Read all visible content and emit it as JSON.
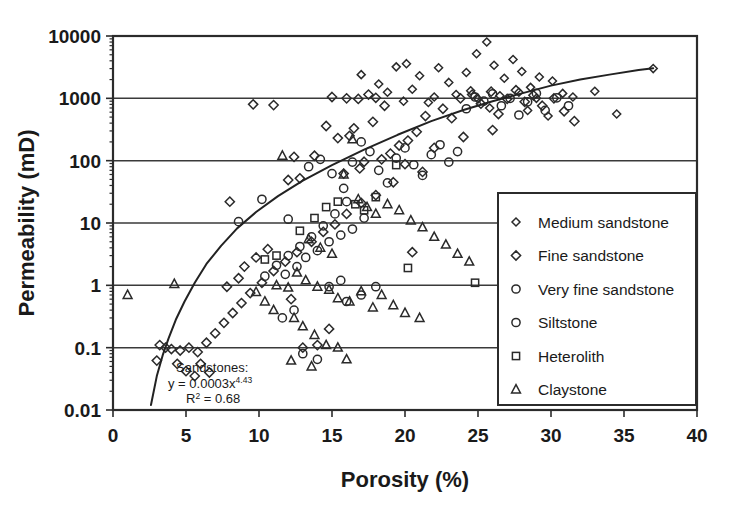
{
  "chart_data": {
    "type": "scatter",
    "title": "",
    "xlabel": "Porosity (%)",
    "ylabel": "Permeability (mD)",
    "xlim": [
      0,
      40
    ],
    "ylim": [
      0.01,
      10000
    ],
    "yscale": "log",
    "xscale": "linear",
    "xticks": [
      0,
      5,
      10,
      15,
      20,
      25,
      30,
      35,
      40
    ],
    "xtick_labels": [
      "0",
      "5",
      "10",
      "15",
      "20",
      "25",
      "30",
      "35",
      "40"
    ],
    "yticks": [
      0.01,
      0.1,
      1,
      10,
      100,
      1000,
      10000
    ],
    "ytick_labels": [
      "0.01",
      "0.1",
      "1",
      "10",
      "100",
      "1000",
      "10000"
    ],
    "grid": "horizontal-major",
    "legend_position": "lower-right-inside",
    "annotation": {
      "line1": "Sandstones:",
      "line2_prefix": "y = 0.0003x",
      "line2_exponent": "4.43",
      "line3_prefix": "R",
      "line3_sup": "2",
      "line3_suffix": " = 0.68"
    },
    "trendline": {
      "label": "Sandstone power-law fit",
      "equation": "y = 0.0003x^4.43",
      "r_squared": 0.68,
      "points": [
        [
          2.6,
          0.012
        ],
        [
          3.0,
          0.035
        ],
        [
          3.4,
          0.075
        ],
        [
          3.8,
          0.14
        ],
        [
          4.3,
          0.28
        ],
        [
          4.9,
          0.55
        ],
        [
          5.6,
          1.1
        ],
        [
          6.4,
          2.2
        ],
        [
          7.4,
          4.3
        ],
        [
          8.5,
          8.2
        ],
        [
          9.8,
          15.0
        ],
        [
          11.3,
          27.0
        ],
        [
          13.0,
          48.0
        ],
        [
          15.0,
          85.0
        ],
        [
          17.2,
          150.0
        ],
        [
          19.5,
          260.0
        ],
        [
          21.8,
          430.0
        ],
        [
          24.0,
          650.0
        ],
        [
          26.0,
          900.0
        ],
        [
          28.0,
          1200.0
        ],
        [
          30.0,
          1600.0
        ],
        [
          32.0,
          2000.0
        ],
        [
          34.0,
          2400.0
        ],
        [
          36.0,
          2850.0
        ],
        [
          37.0,
          3050.0
        ]
      ]
    },
    "series": [
      {
        "name": "Medium sandstone",
        "marker": "diamond-small",
        "points": [
          [
            17.0,
            2400
          ],
          [
            18.2,
            1700
          ],
          [
            19.4,
            3200
          ],
          [
            20.1,
            3600
          ],
          [
            21.0,
            2300
          ],
          [
            22.3,
            3100
          ],
          [
            23.0,
            1800
          ],
          [
            24.2,
            2600
          ],
          [
            24.9,
            5200
          ],
          [
            25.6,
            8000
          ],
          [
            26.1,
            3400
          ],
          [
            26.8,
            2100
          ],
          [
            27.4,
            4200
          ],
          [
            28.0,
            2700
          ],
          [
            28.6,
            1500
          ],
          [
            29.2,
            2200
          ],
          [
            30.1,
            1900
          ],
          [
            30.8,
            1200
          ],
          [
            22.0,
            1050
          ],
          [
            23.5,
            1150
          ],
          [
            25.0,
            980
          ],
          [
            26.5,
            1100
          ],
          [
            27.8,
            1250
          ],
          [
            29.0,
            1000
          ],
          [
            31.5,
            1050
          ],
          [
            33.0,
            1300
          ],
          [
            34.5,
            560
          ],
          [
            37.0,
            3000
          ],
          [
            20.5,
            1400
          ],
          [
            21.6,
            860
          ],
          [
            24.5,
            1320
          ],
          [
            25.8,
            700
          ],
          [
            28.4,
            640
          ],
          [
            29.8,
            520
          ],
          [
            18.8,
            1250
          ],
          [
            19.9,
            900
          ]
        ]
      },
      {
        "name": "Fine sandstone",
        "marker": "diamond",
        "points": [
          [
            8.0,
            22
          ],
          [
            9.6,
            800
          ],
          [
            12.4,
            115
          ],
          [
            13.8,
            120
          ],
          [
            11.0,
            780
          ],
          [
            12.0,
            49
          ],
          [
            12.8,
            52
          ],
          [
            14.6,
            360
          ],
          [
            15.4,
            230
          ],
          [
            16.2,
            250
          ],
          [
            15.0,
            1050
          ],
          [
            16.0,
            1000
          ],
          [
            16.8,
            980
          ],
          [
            17.5,
            1150
          ],
          [
            18.0,
            1020
          ],
          [
            18.6,
            760
          ],
          [
            17.8,
            420
          ],
          [
            16.5,
            330
          ],
          [
            15.8,
            62
          ],
          [
            16.9,
            75
          ],
          [
            17.2,
            96
          ],
          [
            18.4,
            105
          ],
          [
            19.0,
            130
          ],
          [
            19.6,
            175
          ],
          [
            20.2,
            210
          ],
          [
            20.8,
            290
          ],
          [
            21.4,
            520
          ],
          [
            22.6,
            680
          ],
          [
            23.2,
            480
          ],
          [
            23.8,
            1000
          ],
          [
            24.6,
            1150
          ],
          [
            25.2,
            820
          ],
          [
            25.9,
            1280
          ],
          [
            26.4,
            560
          ],
          [
            27.0,
            980
          ],
          [
            27.6,
            1350
          ],
          [
            28.2,
            880
          ],
          [
            28.8,
            1120
          ],
          [
            29.4,
            760
          ],
          [
            30.2,
            1000
          ],
          [
            30.9,
            620
          ],
          [
            31.6,
            430
          ],
          [
            26.0,
            310
          ],
          [
            24.0,
            240
          ],
          [
            22.0,
            160
          ],
          [
            20.0,
            88
          ],
          [
            21.2,
            66
          ],
          [
            19.2,
            45
          ],
          [
            18.0,
            28
          ],
          [
            17.0,
            21
          ],
          [
            16.0,
            14
          ],
          [
            15.2,
            9.5
          ],
          [
            14.4,
            7.2
          ],
          [
            13.6,
            5.0
          ],
          [
            12.6,
            3.4
          ],
          [
            11.8,
            2.4
          ],
          [
            11.0,
            1.7
          ],
          [
            10.2,
            1.1
          ],
          [
            9.4,
            0.75
          ],
          [
            8.8,
            0.52
          ],
          [
            8.2,
            0.36
          ],
          [
            7.6,
            0.25
          ],
          [
            7.0,
            0.17
          ],
          [
            6.4,
            0.12
          ],
          [
            5.8,
            0.085
          ],
          [
            5.2,
            0.1
          ],
          [
            4.6,
            0.09
          ],
          [
            4.0,
            0.095
          ],
          [
            3.6,
            0.1
          ],
          [
            3.2,
            0.11
          ],
          [
            4.4,
            0.055
          ],
          [
            5.0,
            0.042
          ],
          [
            5.6,
            0.035
          ],
          [
            6.0,
            0.055
          ],
          [
            6.6,
            0.04
          ],
          [
            3.0,
            0.062
          ],
          [
            7.8,
            0.95
          ],
          [
            8.6,
            1.3
          ],
          [
            9.0,
            2.0
          ],
          [
            9.8,
            2.8
          ],
          [
            10.6,
            3.8
          ],
          [
            13.0,
            0.1
          ],
          [
            14.0,
            0.11
          ],
          [
            20.5,
            3.4
          ],
          [
            14.8,
            0.2
          ],
          [
            12.2,
            0.6
          ]
        ]
      },
      {
        "name": "Very fine sandstone",
        "marker": "circle",
        "points": [
          [
            8.6,
            10.5
          ],
          [
            10.2,
            24
          ],
          [
            12.0,
            11.5
          ],
          [
            13.4,
            80
          ],
          [
            14.2,
            105
          ],
          [
            15.0,
            62
          ],
          [
            15.8,
            36
          ],
          [
            16.4,
            95
          ],
          [
            17.0,
            200
          ],
          [
            17.6,
            140
          ],
          [
            18.2,
            70
          ],
          [
            18.8,
            44
          ],
          [
            19.4,
            110
          ],
          [
            20.0,
            160
          ],
          [
            20.6,
            86
          ],
          [
            21.2,
            58
          ],
          [
            21.8,
            125
          ],
          [
            22.4,
            180
          ],
          [
            23.0,
            95
          ],
          [
            23.6,
            140
          ],
          [
            24.2,
            680
          ],
          [
            24.8,
            1050
          ],
          [
            25.4,
            900
          ],
          [
            26.0,
            1180
          ],
          [
            26.6,
            760
          ],
          [
            27.2,
            1000
          ],
          [
            27.8,
            540
          ],
          [
            28.4,
            880
          ],
          [
            29.0,
            1200
          ],
          [
            29.6,
            640
          ],
          [
            30.4,
            1020
          ],
          [
            31.2,
            760
          ],
          [
            16.0,
            22
          ],
          [
            15.2,
            14
          ],
          [
            14.4,
            9.0
          ],
          [
            13.6,
            6.0
          ],
          [
            12.8,
            4.2
          ],
          [
            12.0,
            3.0
          ],
          [
            11.2,
            2.1
          ],
          [
            10.4,
            1.4
          ],
          [
            14.8,
            0.95
          ],
          [
            15.6,
            1.2
          ],
          [
            13.0,
            0.08
          ],
          [
            14.0,
            0.065
          ],
          [
            11.6,
            0.3
          ],
          [
            12.4,
            0.4
          ]
        ]
      },
      {
        "name": "Siltstone",
        "marker": "circle-bold",
        "points": [
          [
            13.2,
            2.8
          ],
          [
            14.0,
            3.6
          ],
          [
            14.8,
            5.0
          ],
          [
            15.6,
            6.4
          ],
          [
            16.4,
            8.0
          ],
          [
            17.2,
            12.0
          ],
          [
            12.6,
            2.0
          ],
          [
            11.8,
            1.5
          ],
          [
            16.0,
            0.55
          ],
          [
            17.0,
            0.7
          ],
          [
            18.0,
            0.95
          ]
        ]
      },
      {
        "name": "Heterolith",
        "marker": "square",
        "points": [
          [
            14.6,
            18
          ],
          [
            15.4,
            22
          ],
          [
            16.6,
            20
          ],
          [
            17.2,
            16
          ],
          [
            18.0,
            26
          ],
          [
            19.4,
            85
          ],
          [
            13.8,
            12
          ],
          [
            12.8,
            7.5
          ],
          [
            10.4,
            2.6
          ],
          [
            11.2,
            3.0
          ],
          [
            24.8,
            1.1
          ],
          [
            20.2,
            1.9
          ]
        ]
      },
      {
        "name": "Claystone",
        "marker": "triangle",
        "points": [
          [
            1.0,
            0.7
          ],
          [
            4.2,
            1.05
          ],
          [
            11.6,
            120
          ],
          [
            16.4,
            220
          ],
          [
            15.8,
            60
          ],
          [
            16.8,
            24
          ],
          [
            17.4,
            18
          ],
          [
            18.0,
            14
          ],
          [
            18.8,
            20
          ],
          [
            19.6,
            16
          ],
          [
            20.4,
            11
          ],
          [
            21.2,
            8.5
          ],
          [
            22.0,
            6.0
          ],
          [
            22.8,
            4.5
          ],
          [
            23.6,
            3.2
          ],
          [
            24.4,
            2.4
          ],
          [
            13.4,
            5.5
          ],
          [
            14.2,
            4.0
          ],
          [
            15.0,
            3.2
          ],
          [
            12.6,
            1.6
          ],
          [
            13.2,
            1.2
          ],
          [
            14.0,
            0.95
          ],
          [
            14.8,
            0.85
          ],
          [
            12.0,
            0.92
          ],
          [
            11.2,
            1.0
          ],
          [
            15.4,
            0.62
          ],
          [
            16.2,
            0.55
          ],
          [
            17.0,
            0.8
          ],
          [
            18.4,
            0.7
          ],
          [
            19.2,
            0.48
          ],
          [
            20.0,
            0.36
          ],
          [
            12.4,
            0.3
          ],
          [
            13.0,
            0.22
          ],
          [
            13.8,
            0.16
          ],
          [
            14.6,
            0.11
          ],
          [
            15.4,
            0.1
          ],
          [
            16.0,
            0.065
          ],
          [
            11.0,
            0.4
          ],
          [
            10.4,
            0.55
          ],
          [
            9.8,
            0.78
          ],
          [
            17.8,
            0.44
          ],
          [
            21.0,
            0.3
          ],
          [
            12.2,
            0.062
          ],
          [
            13.6,
            0.05
          ]
        ]
      }
    ],
    "legend_entries": [
      {
        "label": "Medium sandstone",
        "marker": "diamond-small"
      },
      {
        "label": "Fine sandstone",
        "marker": "diamond"
      },
      {
        "label": "Very fine sandstone",
        "marker": "circle"
      },
      {
        "label": "Siltstone",
        "marker": "circle-bold"
      },
      {
        "label": "Heterolith",
        "marker": "square"
      },
      {
        "label": "Claystone",
        "marker": "triangle"
      }
    ],
    "colors": {
      "marker": "#2a2a2a",
      "line": "#222222",
      "grid": "#3a3a3a",
      "frame": "#2b2b2b",
      "background": "#ffffff"
    }
  }
}
